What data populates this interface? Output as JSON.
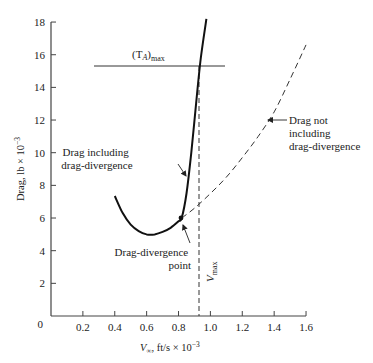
{
  "chart_data": {
    "type": "line",
    "title": "",
    "xlabel": "V∞, ft/s × 10⁻³",
    "ylabel": "Drag, lb × 10⁻³",
    "xlim": [
      0,
      1.6
    ],
    "ylim": [
      0,
      18
    ],
    "grid": false,
    "x_ticks": [
      "0.2",
      "0.4",
      "0.6",
      "0.8",
      "1.0",
      "1.2",
      "1.4",
      "1.6"
    ],
    "y_ticks": [
      "0",
      "2",
      "4",
      "6",
      "8",
      "10",
      "12",
      "14",
      "16",
      "18"
    ],
    "series": [
      {
        "name": "Drag including drag-divergence",
        "style": "solid-thick",
        "x": [
          0.4,
          0.45,
          0.5,
          0.55,
          0.6,
          0.65,
          0.7,
          0.75,
          0.8,
          0.82,
          0.85,
          0.88,
          0.91,
          0.94,
          0.975
        ],
        "y": [
          7.35,
          6.3,
          5.6,
          5.2,
          5.0,
          5.0,
          5.15,
          5.4,
          5.8,
          6.0,
          7.5,
          10.0,
          13.0,
          15.8,
          18.2
        ]
      },
      {
        "name": "Drag not including drag-divergence",
        "style": "dashed",
        "x": [
          0.82,
          0.9,
          1.0,
          1.1,
          1.2,
          1.3,
          1.4,
          1.5,
          1.6
        ],
        "y": [
          6.0,
          6.6,
          7.5,
          8.5,
          9.7,
          11.0,
          12.5,
          14.5,
          16.6
        ]
      }
    ],
    "reference_lines": [
      {
        "name": "(T_A)max",
        "orientation": "horizontal",
        "y": 15.3,
        "x_range": [
          0.27,
          1.1
        ],
        "style": "solid-thin"
      },
      {
        "name": "V_max",
        "orientation": "vertical",
        "x": 0.93,
        "y_range": [
          0,
          15.3
        ],
        "style": "dashed"
      }
    ],
    "annotations": [
      {
        "text": "(T_A)max",
        "at": [
          0.55,
          16.0
        ]
      },
      {
        "text": "Drag including drag-divergence",
        "arrow_to": [
          0.91,
          13.0
        ]
      },
      {
        "text": "Drag not including drag-divergence",
        "arrow_to": [
          1.35,
          12.0
        ]
      },
      {
        "text": "Drag-divergence point",
        "arrow_to": [
          0.82,
          6.0
        ]
      },
      {
        "text": "V_max",
        "at": [
          0.95,
          3.0
        ],
        "rotated": true
      }
    ]
  },
  "labels": {
    "ylabel_main": "Drag, lb × 10",
    "ylabel_exp": "−3",
    "xlabel_v": "V",
    "xlabel_sub": "∞",
    "xlabel_rest": ", ft/s × 10",
    "xlabel_exp": "−3",
    "ta_max_main": "(T",
    "ta_max_sub_A": "A",
    "ta_max_close": ")",
    "ta_max_sub": "max",
    "drag_incl_line1": "Drag including",
    "drag_incl_line2": "drag-divergence",
    "drag_not_line1": "Drag not",
    "drag_not_line2": "including",
    "drag_not_line3": "drag-divergence",
    "ddp_line1": "Drag-divergence",
    "ddp_line2": "point",
    "vmax_main": "V",
    "vmax_sub": "max"
  }
}
